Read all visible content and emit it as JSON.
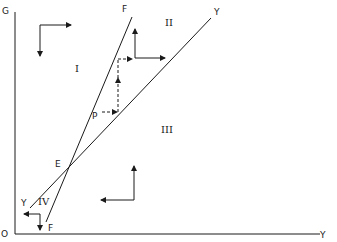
{
  "axes": {
    "y_label": "G",
    "x_label": "Y",
    "origin_label": "O"
  },
  "lines": {
    "ff": {
      "label_top": "F",
      "label_bottom": "F"
    },
    "yy": {
      "label_top": "Y",
      "label_bottom": "Y"
    }
  },
  "points": {
    "intersection": "E",
    "p": "P"
  },
  "regions": {
    "r1": "I",
    "r2": "II",
    "r3": "III",
    "r4": "IV"
  },
  "colors": {
    "ink": "#1a1a1a",
    "background": "#ffffff"
  }
}
